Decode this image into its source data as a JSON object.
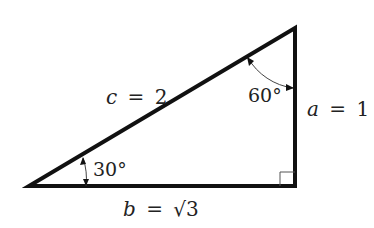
{
  "diagram": {
    "type": "right-triangle",
    "vertices": {
      "A": {
        "x": 29,
        "y": 186
      },
      "C": {
        "x": 295,
        "y": 186
      },
      "B": {
        "x": 295,
        "y": 28
      }
    },
    "sides": {
      "hypotenuse": {
        "var": "c",
        "eq": "=",
        "val": "2"
      },
      "vertical": {
        "var": "a",
        "eq": "=",
        "val": "1"
      },
      "base": {
        "var": "b",
        "eq": "=",
        "val": "√3"
      }
    },
    "angles": {
      "bottom_left": "30°",
      "top_right": "60°",
      "right_angle": true
    },
    "colors": {
      "stroke": "#111111",
      "arc": "#555555",
      "text": "#222222"
    }
  }
}
